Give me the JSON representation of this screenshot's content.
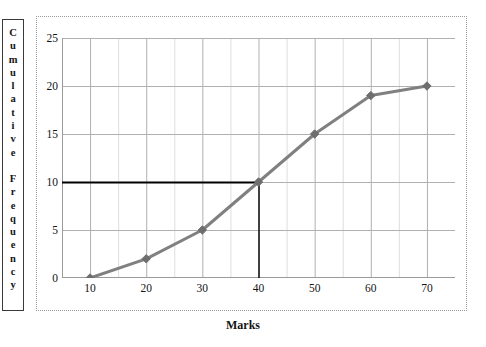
{
  "chart_data": {
    "type": "line",
    "title": "",
    "subtitle": "",
    "xlabel": "Marks",
    "ylabel": "Cumulative Frequency",
    "x": [
      10,
      20,
      30,
      40,
      50,
      60,
      70
    ],
    "values": [
      0,
      2,
      5,
      10,
      15,
      19,
      20
    ],
    "series": [
      {
        "name": "Cumulative frequency",
        "x": [
          10,
          20,
          30,
          40,
          50,
          60,
          70
        ],
        "values": [
          0,
          2,
          5,
          10,
          15,
          19,
          20
        ],
        "color": "#808080",
        "marker": "diamond"
      }
    ],
    "xlim": [
      5,
      75
    ],
    "ylim": [
      0,
      25
    ],
    "xticks": [
      10,
      20,
      30,
      40,
      50,
      60,
      70
    ],
    "xtick_labels": [
      "10",
      "20",
      "30",
      "40",
      "50",
      "60",
      "70"
    ],
    "yticks": [
      0,
      5,
      10,
      15,
      20,
      25
    ],
    "ytick_labels": [
      "0",
      "5",
      "10",
      "15",
      "20",
      "25"
    ],
    "grid": true,
    "grid_major_color": "#b0b0b0",
    "grid_minor_color": "#dedede",
    "minor_x_step": 5,
    "legend": false,
    "legend_position": "none",
    "annotations": [
      {
        "name": "median-horizontal-reference-line",
        "type": "hline",
        "y": 10,
        "x_from": 5,
        "x_to": 40,
        "color": "#000000"
      },
      {
        "name": "median-vertical-reference-line",
        "type": "vline",
        "x": 40,
        "y_from": 0,
        "y_to": 10,
        "color": "#000000"
      }
    ]
  },
  "axis_titles": {
    "y_letters": [
      "C",
      "u",
      "m",
      "u",
      "l",
      "a",
      "t",
      "i",
      "v",
      "e",
      "",
      "F",
      "r",
      "e",
      "q",
      "u",
      "e",
      "n",
      "c",
      "y"
    ],
    "x_label": "Marks"
  },
  "colors": {
    "series": "#808080",
    "marker": "#6e6e6e",
    "reference_line": "#000000",
    "axis": "#9a9a9a",
    "grid_major": "#b0b0b0",
    "grid_minor": "#dedede",
    "frame_dotted": "#9a9a9a",
    "text": "#141414",
    "background": "#ffffff"
  }
}
